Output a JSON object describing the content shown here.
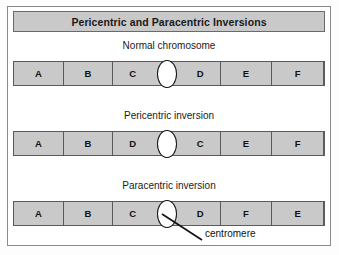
{
  "title": "Pericentric and Paracentric Inversions",
  "colors": {
    "segment_fill": "#c9c9c9",
    "segment_border": "#5a5a5a",
    "title_fill": "#c9c9c9",
    "frame_border": "#8b8b8b",
    "centromere_fill": "#ffffff",
    "text": "#111111"
  },
  "annotation": {
    "label": "centromere"
  },
  "diagram": {
    "type": "chromosome-inversion-diagram",
    "rows": [
      {
        "caption": "Normal chromosome",
        "segments": [
          {
            "label": "A",
            "width": 50
          },
          {
            "label": "B",
            "width": 50
          },
          {
            "label": "C",
            "width": 54
          },
          {
            "label": "D",
            "width": 54
          },
          {
            "label": "E",
            "width": 52
          },
          {
            "label": "F",
            "width": 52
          }
        ],
        "centromere_after_segment": 3
      },
      {
        "caption": "Pericentric inversion",
        "segments": [
          {
            "label": "A",
            "width": 50
          },
          {
            "label": "B",
            "width": 50
          },
          {
            "label": "D",
            "width": 54
          },
          {
            "label": "C",
            "width": 54
          },
          {
            "label": "E",
            "width": 52
          },
          {
            "label": "F",
            "width": 52
          }
        ],
        "centromere_after_segment": 3
      },
      {
        "caption": "Paracentric inversion",
        "segments": [
          {
            "label": "A",
            "width": 50
          },
          {
            "label": "B",
            "width": 50
          },
          {
            "label": "C",
            "width": 54
          },
          {
            "label": "D",
            "width": 54
          },
          {
            "label": "F",
            "width": 52
          },
          {
            "label": "E",
            "width": 52
          }
        ],
        "centromere_after_segment": 3
      }
    ]
  }
}
